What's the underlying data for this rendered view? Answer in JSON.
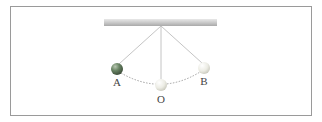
{
  "diagram": {
    "labels": {
      "left_extreme": "A",
      "mean_position": "O",
      "right_extreme": "B"
    },
    "colors": {
      "support_bar": "#c9c9c9",
      "string": "#bdbdbd",
      "path": "#8a8a8a",
      "bob_active": "#5f7a5a",
      "bob_ghost": "#e6e6de",
      "frame": "#9a9a9a"
    }
  }
}
